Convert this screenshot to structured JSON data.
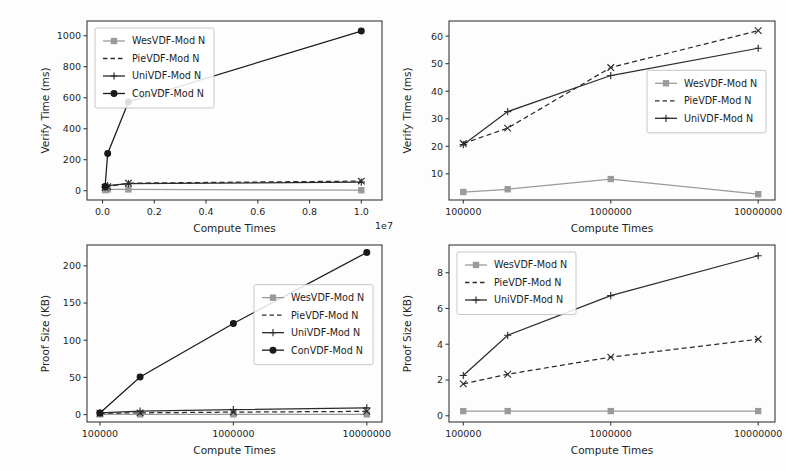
{
  "figure": {
    "background": "#fdfdfd",
    "axis_color": "#3a3a3a",
    "panel_count": 4
  },
  "series_styles": {
    "WesVDF-Mod N": {
      "color": "#9a9a9a",
      "marker": "square",
      "dash": "none"
    },
    "PieVDF-Mod N": {
      "color": "#2b2b2b",
      "marker": "x",
      "dash": "dashed"
    },
    "UniVDF-Mod N": {
      "color": "#2b2b2b",
      "marker": "plus",
      "dash": "none"
    },
    "ConVDF-Mod N": {
      "color": "#1a1a1a",
      "marker": "circle",
      "dash": "none"
    }
  },
  "chart_data": [
    {
      "id": "verify-time-linear",
      "position": "top-left",
      "type": "line",
      "title": "",
      "xlabel": "Compute Times",
      "ylabel": "Verify Time (ms)",
      "x_exponent_label": "1e7",
      "x_scale": "linear",
      "xlim": [
        -0.06,
        1.08
      ],
      "ylim": [
        -60,
        1095
      ],
      "x_tick_values": [
        0.0,
        0.2,
        0.4,
        0.6,
        0.8,
        1.0
      ],
      "x_tick_labels": [
        "0.0",
        "0.2",
        "0.4",
        "0.6",
        "0.8",
        "1.0"
      ],
      "y_tick_values": [
        0,
        200,
        400,
        600,
        800,
        1000
      ],
      "y_tick_labels": [
        "0",
        "200",
        "400",
        "600",
        "800",
        "1000"
      ],
      "grid": false,
      "legend_position": "upper-left",
      "x": [
        0.01,
        0.02,
        0.1,
        1.0
      ],
      "series": [
        {
          "name": "WesVDF-Mod N",
          "values": [
            3.5,
            8.0,
            8.2,
            3.0
          ]
        },
        {
          "name": "PieVDF-Mod N",
          "values": [
            21.0,
            26.5,
            48.5,
            62.0
          ]
        },
        {
          "name": "UniVDF-Mod N",
          "values": [
            20.7,
            32.5,
            45.8,
            55.5
          ]
        },
        {
          "name": "ConVDF-Mod N",
          "values": [
            27.0,
            240.0,
            573.0,
            1030.0
          ]
        }
      ]
    },
    {
      "id": "verify-time-log",
      "position": "top-right",
      "type": "line",
      "title": "",
      "xlabel": "Compute Times",
      "ylabel": "Verify Time (ms)",
      "x_scale": "log",
      "xlim": [
        80000,
        13000000
      ],
      "ylim": [
        0.5,
        65.5
      ],
      "x_tick_values": [
        100000,
        1000000,
        10000000
      ],
      "x_tick_labels": [
        "100000",
        "1000000",
        "10000000"
      ],
      "y_tick_values": [
        10,
        20,
        30,
        40,
        50,
        60
      ],
      "y_tick_labels": [
        "10",
        "20",
        "30",
        "40",
        "50",
        "60"
      ],
      "grid": false,
      "legend_position": "middle-right",
      "x": [
        100000,
        200000,
        1000000,
        10000000
      ],
      "series": [
        {
          "name": "WesVDF-Mod N",
          "values": [
            3.4,
            4.4,
            8.1,
            2.6
          ]
        },
        {
          "name": "PieVDF-Mod N",
          "values": [
            21.0,
            26.6,
            48.6,
            62.0
          ]
        },
        {
          "name": "UniVDF-Mod N",
          "values": [
            20.6,
            32.6,
            45.7,
            55.6
          ]
        }
      ]
    },
    {
      "id": "proof-size-large",
      "position": "bottom-left",
      "type": "line",
      "title": "",
      "xlabel": "Compute Times",
      "ylabel": "Proof Size (KB)",
      "x_scale": "log",
      "xlim": [
        80000,
        13000000
      ],
      "ylim": [
        -10,
        228
      ],
      "x_tick_values": [
        100000,
        1000000,
        10000000
      ],
      "x_tick_labels": [
        "100000",
        "1000000",
        "10000000"
      ],
      "y_tick_values": [
        0,
        50,
        100,
        150,
        200
      ],
      "y_tick_labels": [
        "0",
        "50",
        "100",
        "150",
        "200"
      ],
      "grid": false,
      "legend_position": "middle-right",
      "x": [
        100000,
        200000,
        1000000,
        10000000
      ],
      "series": [
        {
          "name": "WesVDF-Mod N",
          "values": [
            0.26,
            0.26,
            0.26,
            0.26
          ]
        },
        {
          "name": "PieVDF-Mod N",
          "values": [
            1.8,
            2.3,
            3.3,
            4.3
          ]
        },
        {
          "name": "UniVDF-Mod N",
          "values": [
            2.2,
            4.5,
            6.7,
            9.0
          ]
        },
        {
          "name": "ConVDF-Mod N",
          "values": [
            2.0,
            50.5,
            122.5,
            218.0
          ]
        }
      ]
    },
    {
      "id": "proof-size-small",
      "position": "bottom-right",
      "type": "line",
      "title": "",
      "xlabel": "Compute Times",
      "ylabel": "Proof Size (KB)",
      "x_scale": "log",
      "xlim": [
        80000,
        13000000
      ],
      "ylim": [
        -0.35,
        9.55
      ],
      "x_tick_values": [
        100000,
        1000000,
        10000000
      ],
      "x_tick_labels": [
        "100000",
        "1000000",
        "10000000"
      ],
      "y_tick_values": [
        0,
        2,
        4,
        6,
        8
      ],
      "y_tick_labels": [
        "0",
        "2",
        "4",
        "6",
        "8"
      ],
      "grid": false,
      "legend_position": "upper-left",
      "x": [
        100000,
        200000,
        1000000,
        10000000
      ],
      "series": [
        {
          "name": "WesVDF-Mod N",
          "values": [
            0.26,
            0.26,
            0.26,
            0.26
          ]
        },
        {
          "name": "PieVDF-Mod N",
          "values": [
            1.78,
            2.32,
            3.28,
            4.28
          ]
        },
        {
          "name": "UniVDF-Mod N",
          "values": [
            2.25,
            4.5,
            6.72,
            8.95
          ]
        }
      ]
    }
  ]
}
